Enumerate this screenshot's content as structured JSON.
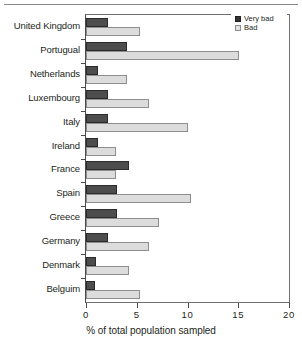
{
  "chart_data": {
    "type": "bar",
    "orientation": "horizontal",
    "title": "",
    "xlabel": "% of total population sampled",
    "ylabel": "",
    "xlim": [
      0,
      20
    ],
    "xticks": [
      0,
      5,
      10,
      15,
      20
    ],
    "xtick_labels": [
      "0",
      "5",
      "10",
      "15",
      "20"
    ],
    "grid": false,
    "legend_position": "top-right",
    "categories": [
      "United Kingdom",
      "Portugual",
      "Netherlands",
      "Luxembourg",
      "Italy",
      "Ireland",
      "France",
      "Spain",
      "Greece",
      "Germany",
      "Denmark",
      "Belguim"
    ],
    "series": [
      {
        "name": "Very bad",
        "color": "#4d4d4d",
        "values": [
          2.2,
          4.0,
          1.2,
          2.2,
          2.2,
          1.2,
          4.2,
          3.1,
          3.1,
          2.2,
          1.0,
          0.9
        ]
      },
      {
        "name": "Bad",
        "color": "#dcdcdc",
        "values": [
          5.3,
          15.1,
          4.0,
          6.2,
          10.0,
          3.0,
          3.0,
          10.3,
          7.2,
          6.2,
          4.2,
          5.3
        ]
      }
    ]
  },
  "legend": {
    "items": [
      {
        "label": "Very bad",
        "swatch": "very-bad"
      },
      {
        "label": "Bad",
        "swatch": "bad"
      }
    ]
  }
}
